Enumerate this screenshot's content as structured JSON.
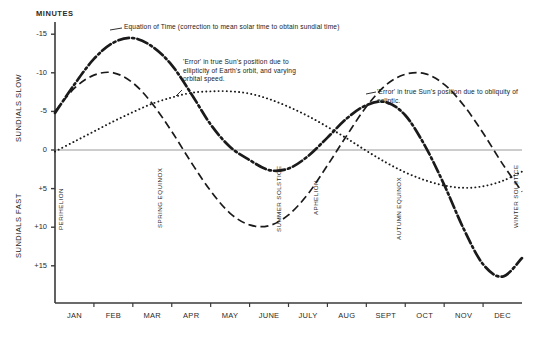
{
  "chart_data": {
    "type": "line",
    "title": "Equation of Time",
    "ylabel": "MINUTES",
    "xlabel": "",
    "ylim": [
      -16.5,
      17.5
    ],
    "y_axis_inverted": true,
    "grid": false,
    "legend_position": "inline-annotations",
    "yticks": [
      -15,
      -10,
      -5,
      0,
      5,
      10,
      15
    ],
    "ytick_labels": [
      "-15",
      "-10",
      "-5",
      "0",
      "+5",
      "+10",
      "+15"
    ],
    "categories": [
      "JAN",
      "FEB",
      "MAR",
      "APR",
      "MAY",
      "JUNE",
      "JULY",
      "AUG",
      "SEPT",
      "OCT",
      "NOV",
      "DEC"
    ],
    "x_unit": "month",
    "series": [
      {
        "name": "Equation of Time",
        "style": "dash-dot",
        "x": [
          0,
          0.5,
          1,
          1.5,
          2,
          2.5,
          3,
          3.5,
          4,
          4.5,
          5,
          5.5,
          6,
          6.5,
          7,
          7.5,
          8,
          8.5,
          9,
          9.5,
          10,
          10.5,
          11,
          11.5,
          12
        ],
        "values": [
          -4.8,
          -8.5,
          -11.8,
          -13.9,
          -14.5,
          -13.4,
          -11.0,
          -7.3,
          -3.3,
          -0.4,
          1.3,
          2.6,
          2.4,
          0.8,
          -1.6,
          -4.1,
          -5.8,
          -6.2,
          -4.5,
          -0.6,
          4.5,
          10.2,
          14.8,
          16.4,
          14.0
        ]
      },
      {
        "name": "'Error' in true Sun's position due to obliquity of ecliptic",
        "style": "dashed",
        "x": [
          0,
          0.5,
          1,
          1.5,
          2,
          2.5,
          3,
          3.5,
          4,
          4.5,
          5,
          5.5,
          6,
          6.5,
          7,
          7.5,
          8,
          8.5,
          9,
          9.5,
          10,
          10.5,
          11,
          11.5,
          12
        ],
        "values": [
          -5.0,
          -8.0,
          -9.7,
          -10.0,
          -8.7,
          -6.0,
          -2.4,
          1.6,
          5.3,
          8.2,
          9.7,
          9.8,
          8.4,
          5.7,
          2.0,
          -1.9,
          -5.6,
          -8.4,
          -9.8,
          -9.9,
          -8.5,
          -5.8,
          -2.2,
          1.8,
          5.4
        ]
      },
      {
        "name": "'Error' in true Sun's position due to ellipticity of Earth's orbit, and varying orbital speed",
        "style": "dotted",
        "x": [
          0,
          0.5,
          1,
          1.5,
          2,
          2.5,
          3,
          3.5,
          4,
          4.5,
          5,
          5.5,
          6,
          6.5,
          7,
          7.5,
          8,
          8.5,
          9,
          9.5,
          10,
          10.5,
          11,
          11.5,
          12
        ],
        "values": [
          0.2,
          -1.1,
          -2.4,
          -3.7,
          -4.9,
          -6.0,
          -6.8,
          -7.4,
          -7.6,
          -7.6,
          -7.3,
          -6.6,
          -5.6,
          -4.4,
          -3.0,
          -1.5,
          0.1,
          1.6,
          2.9,
          3.9,
          4.6,
          4.9,
          4.7,
          4.0,
          2.8
        ]
      }
    ],
    "annotations": [
      {
        "name": "equation-of-time",
        "text": "Equation of Time (correction to mean solar time to obtain sundial time)"
      },
      {
        "name": "ellipticity",
        "text": "'Error' in true Sun's position due to\nellipticity of Earth's orbit, and varying\norbital speed."
      },
      {
        "name": "obliquity",
        "text": "'Error' in true Sun's position due to obliquity of\necliptic."
      }
    ],
    "event_markers": [
      {
        "name": "perihelion",
        "label": "PERIHELION",
        "month_fraction": 0.1
      },
      {
        "name": "spring-equinox",
        "label": "SPRING EQUINOX",
        "month_fraction": 2.65
      },
      {
        "name": "summer-solstice",
        "label": "SUMMER SOLSTICE",
        "month_fraction": 5.7
      },
      {
        "name": "aphelion",
        "label": "APHELION",
        "month_fraction": 6.65
      },
      {
        "name": "autumn-equinox",
        "label": "AUTUMN EQUINOX",
        "month_fraction": 8.8
      },
      {
        "name": "winter-solstice",
        "label": "WINTER SOLSTICE",
        "month_fraction": 11.8
      }
    ],
    "colors": {
      "ink": "#1a1a1a",
      "zero_line": "#9a9a9a",
      "axis": "#3a3a3a"
    }
  },
  "axis": {
    "y_title": "MINUTES",
    "left_upper_label": "SUNDIALS SLOW",
    "left_lower_label": "SUNDIALS FAST"
  }
}
